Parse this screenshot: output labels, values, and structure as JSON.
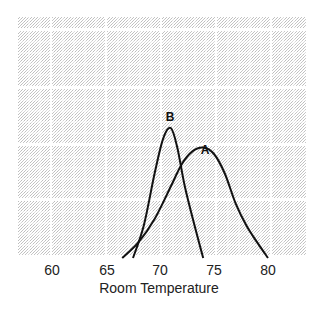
{
  "chart_data": {
    "type": "line",
    "title": "",
    "xlabel": "Room Temperature",
    "ylabel": "",
    "x_ticks": [
      60,
      65,
      70,
      75,
      80
    ],
    "xlim": [
      57,
      83
    ],
    "grid": true,
    "legend": "inline labels",
    "series": [
      {
        "name": "A",
        "x": [
          66.5,
          68,
          69.5,
          71,
          72,
          73,
          74,
          75,
          76,
          77,
          78,
          79,
          80
        ],
        "y": [
          0,
          0.12,
          0.3,
          0.55,
          0.72,
          0.82,
          0.85,
          0.8,
          0.65,
          0.42,
          0.25,
          0.12,
          0
        ]
      },
      {
        "name": "B",
        "x": [
          67.5,
          68.5,
          69.5,
          70.3,
          71,
          71.6,
          72.3,
          73.2,
          74
        ],
        "y": [
          0,
          0.25,
          0.65,
          0.92,
          1.0,
          0.85,
          0.55,
          0.25,
          0
        ]
      }
    ]
  },
  "labels": {
    "ticks": [
      "60",
      "65",
      "70",
      "75",
      "80"
    ],
    "xlabel": "Room Temperature",
    "curve_a": "A",
    "curve_b": "B"
  },
  "colors": {
    "grid_fill": "#d9d9d9",
    "curve": "#111111",
    "text": "#222222"
  }
}
